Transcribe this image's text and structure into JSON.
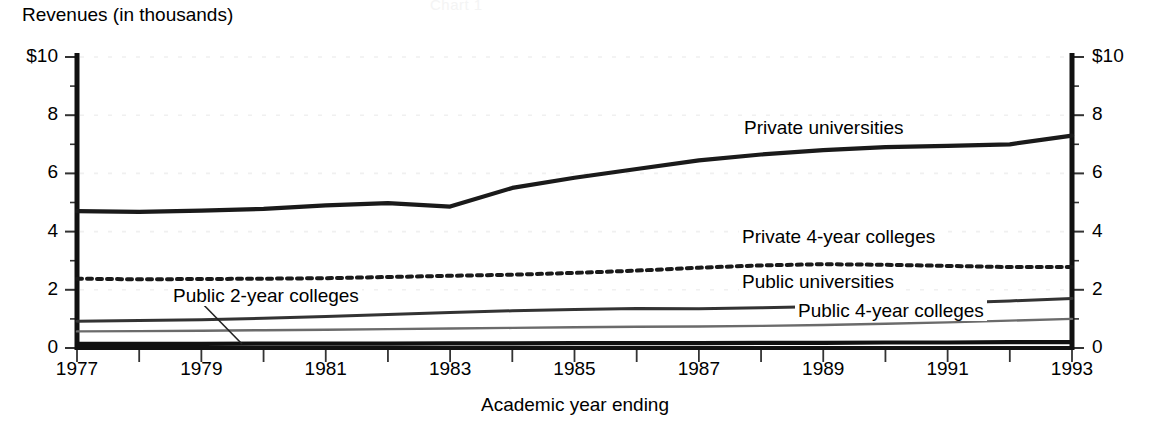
{
  "cut_title": "Chart 1",
  "chart_data": {
    "type": "line",
    "title": "Revenues (in thousands)",
    "xlabel": "Academic year ending",
    "ylabel": "Revenues (in thousands)",
    "xlim": [
      1977,
      1993
    ],
    "ylim": [
      0,
      10
    ],
    "grid": true,
    "legend_position": "inline-labels",
    "x": [
      1977,
      1978,
      1979,
      1980,
      1981,
      1982,
      1983,
      1984,
      1985,
      1986,
      1987,
      1988,
      1989,
      1990,
      1991,
      1992,
      1993
    ],
    "x_tick_labels": [
      "1977",
      "",
      "1979",
      "",
      "1981",
      "",
      "1983",
      "",
      "1985",
      "",
      "1987",
      "",
      "1989",
      "",
      "1991",
      "",
      "1993"
    ],
    "y_tick_labels_left": [
      "$10",
      "8",
      "6",
      "4",
      "2",
      "0"
    ],
    "y_tick_labels_right": [
      "$10",
      "8",
      "6",
      "4",
      "2",
      "0"
    ],
    "y_ticks": [
      10,
      8,
      6,
      4,
      2,
      0
    ],
    "series": [
      {
        "name": "Private universities",
        "style": "solid-thick",
        "color": "#1a1a1a",
        "values": [
          4.7,
          4.68,
          4.72,
          4.78,
          4.9,
          4.98,
          4.86,
          5.5,
          5.85,
          6.15,
          6.45,
          6.65,
          6.8,
          6.9,
          6.95,
          7.0,
          7.3
        ]
      },
      {
        "name": "Private 4-year colleges",
        "style": "dotted",
        "color": "#1a1a1a",
        "values": [
          2.38,
          2.36,
          2.37,
          2.38,
          2.4,
          2.44,
          2.48,
          2.52,
          2.58,
          2.66,
          2.76,
          2.84,
          2.88,
          2.86,
          2.82,
          2.78,
          2.78
        ]
      },
      {
        "name": "Public universities",
        "style": "solid-medium",
        "color": "#333333",
        "values": [
          0.92,
          0.94,
          0.97,
          1.02,
          1.08,
          1.15,
          1.22,
          1.28,
          1.32,
          1.36,
          1.35,
          1.38,
          1.43,
          1.48,
          1.55,
          1.62,
          1.7
        ]
      },
      {
        "name": "Public 4-year colleges",
        "style": "solid-thin",
        "color": "#6b6b6b",
        "values": [
          0.57,
          0.58,
          0.59,
          0.61,
          0.63,
          0.65,
          0.67,
          0.69,
          0.71,
          0.73,
          0.74,
          0.76,
          0.79,
          0.83,
          0.88,
          0.94,
          1.0
        ]
      },
      {
        "name": "Public 2-year colleges",
        "style": "solid-thick",
        "color": "#111111",
        "values": [
          0.14,
          0.14,
          0.14,
          0.15,
          0.15,
          0.15,
          0.16,
          0.16,
          0.17,
          0.17,
          0.17,
          0.18,
          0.18,
          0.19,
          0.19,
          0.2,
          0.2
        ]
      }
    ],
    "annotations": [
      {
        "text": "Private universities",
        "x_px": 741,
        "y_px": 117
      },
      {
        "text": "Private 4-year colleges",
        "x_px": 739,
        "y_px": 226
      },
      {
        "text": "Public universities",
        "x_px": 739,
        "y_px": 271
      },
      {
        "text": "Public 4-year colleges",
        "x_px": 795,
        "y_px": 300
      },
      {
        "text": "Public 2-year colleges",
        "x_px": 170,
        "y_px": 285
      }
    ]
  }
}
